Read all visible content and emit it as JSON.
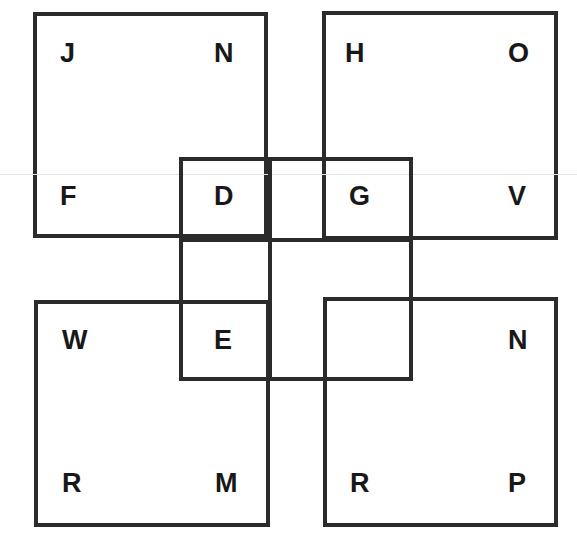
{
  "canvas": {
    "width": 577,
    "height": 543,
    "background": "#ffffff",
    "stroke_color": "#2b2b2b",
    "text_color": "#181818",
    "artifact_color": "#e3e3e3"
  },
  "squares": {
    "top_left": {
      "name": "top-left-square",
      "x": 33,
      "y": 12,
      "w": 235,
      "h": 226,
      "letters": [
        {
          "id": "tl-corner-top-left",
          "text": "J",
          "x": 60,
          "y": 40
        },
        {
          "id": "tl-corner-top-right",
          "text": "N",
          "x": 214,
          "y": 40
        },
        {
          "id": "tl-corner-bottom-left",
          "text": "F",
          "x": 60,
          "y": 183
        }
      ]
    },
    "top_right": {
      "name": "top-right-square",
      "x": 322,
      "y": 11,
      "w": 236,
      "h": 229,
      "letters": [
        {
          "id": "tr-corner-top-left",
          "text": "H",
          "x": 345,
          "y": 40
        },
        {
          "id": "tr-corner-top-right",
          "text": "O",
          "x": 508,
          "y": 40
        },
        {
          "id": "tr-corner-bottom-right",
          "text": "V",
          "x": 508,
          "y": 183
        }
      ]
    },
    "bottom_left": {
      "name": "bottom-left-square",
      "x": 34,
      "y": 300,
      "w": 236,
      "h": 227,
      "letters": [
        {
          "id": "bl-corner-top-left",
          "text": "W",
          "x": 62,
          "y": 327
        },
        {
          "id": "bl-corner-bottom-left",
          "text": "R",
          "x": 62,
          "y": 470
        },
        {
          "id": "bl-corner-bottom-right",
          "text": "M",
          "x": 215,
          "y": 470
        }
      ]
    },
    "bottom_right": {
      "name": "bottom-right-square",
      "x": 323,
      "y": 297,
      "w": 235,
      "h": 230,
      "letters": [
        {
          "id": "br-corner-top-right",
          "text": "N",
          "x": 508,
          "y": 327
        },
        {
          "id": "br-corner-bottom-left",
          "text": "R",
          "x": 350,
          "y": 470
        },
        {
          "id": "br-corner-bottom-right",
          "text": "P",
          "x": 508,
          "y": 470
        }
      ]
    },
    "center": {
      "name": "center-square",
      "x": 179,
      "y": 157,
      "w": 234,
      "h": 224,
      "divider_vertical_x": 268,
      "divider_horizontal_y": 238,
      "letters": [
        {
          "id": "center-cell-top-left",
          "text": "D",
          "x": 214,
          "y": 183
        },
        {
          "id": "center-cell-top-right",
          "text": "G",
          "x": 349,
          "y": 183
        },
        {
          "id": "center-cell-bottom-left",
          "text": "E",
          "x": 214,
          "y": 327
        },
        {
          "id": "center-cell-bottom-right",
          "text": "",
          "x": 349,
          "y": 327
        }
      ]
    }
  },
  "artifacts": {
    "scan_line_y": 174
  },
  "chart_data": {
    "type": "diagram",
    "title": "",
    "shapes": [
      {
        "shape": "square",
        "id": "top-left-square",
        "x": 33,
        "y": 12,
        "w": 235,
        "h": 226,
        "stroke": "#2b2b2b",
        "stroke_width": 4,
        "fill": "none"
      },
      {
        "shape": "square",
        "id": "top-right-square",
        "x": 322,
        "y": 11,
        "w": 236,
        "h": 229,
        "stroke": "#2b2b2b",
        "stroke_width": 4,
        "fill": "none"
      },
      {
        "shape": "square",
        "id": "bottom-left-square",
        "x": 34,
        "y": 300,
        "w": 236,
        "h": 227,
        "stroke": "#2b2b2b",
        "stroke_width": 4,
        "fill": "none"
      },
      {
        "shape": "square",
        "id": "bottom-right-square",
        "x": 323,
        "y": 297,
        "w": 235,
        "h": 230,
        "stroke": "#2b2b2b",
        "stroke_width": 4,
        "fill": "none"
      },
      {
        "shape": "square",
        "id": "center-square",
        "x": 179,
        "y": 157,
        "w": 234,
        "h": 224,
        "stroke": "#2b2b2b",
        "stroke_width": 4,
        "fill": "none"
      }
    ],
    "labels": [
      {
        "text": "J",
        "x": 60,
        "y": 40,
        "region": "top-left-square / top-left corner"
      },
      {
        "text": "N",
        "x": 214,
        "y": 40,
        "region": "top-left-square / top-right corner"
      },
      {
        "text": "H",
        "x": 345,
        "y": 40,
        "region": "top-right-square / top-left corner"
      },
      {
        "text": "O",
        "x": 508,
        "y": 40,
        "region": "top-right-square / top-right corner"
      },
      {
        "text": "F",
        "x": 60,
        "y": 183,
        "region": "top-left-square / bottom-left corner"
      },
      {
        "text": "D",
        "x": 214,
        "y": 183,
        "region": "center-square / top-left cell (overlaps top-left-square)"
      },
      {
        "text": "G",
        "x": 349,
        "y": 183,
        "region": "center-square / top-right cell (overlaps top-right-square)"
      },
      {
        "text": "V",
        "x": 508,
        "y": 183,
        "region": "top-right-square / bottom-right corner"
      },
      {
        "text": "W",
        "x": 62,
        "y": 327,
        "region": "bottom-left-square / top-left corner"
      },
      {
        "text": "E",
        "x": 214,
        "y": 327,
        "region": "center-square / bottom-left cell (overlaps bottom-left-square)"
      },
      {
        "text": "N",
        "x": 508,
        "y": 327,
        "region": "bottom-right-square / top-right corner"
      },
      {
        "text": "R",
        "x": 62,
        "y": 470,
        "region": "bottom-left-square / bottom-left corner"
      },
      {
        "text": "M",
        "x": 215,
        "y": 470,
        "region": "bottom-left-square / bottom-right corner"
      },
      {
        "text": "R",
        "x": 350,
        "y": 470,
        "region": "bottom-right-square / bottom-left corner"
      },
      {
        "text": "P",
        "x": 508,
        "y": 470,
        "region": "bottom-right-square / bottom-right corner"
      }
    ],
    "letters_reading_order": [
      "J",
      "N",
      "H",
      "O",
      "F",
      "D",
      "G",
      "V",
      "W",
      "E",
      "N",
      "R",
      "M",
      "R",
      "P"
    ]
  }
}
